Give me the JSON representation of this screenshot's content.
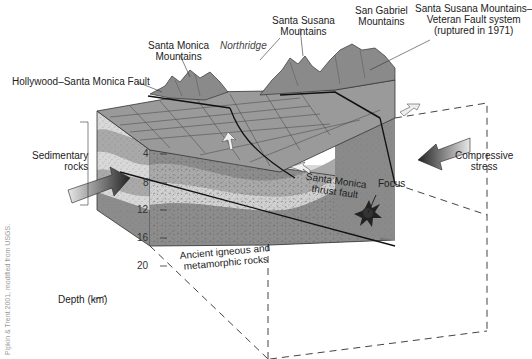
{
  "diagram": {
    "labels": {
      "santa_monica_mountains": [
        "Santa Monica",
        "Mountains"
      ],
      "northridge": "Northridge",
      "santa_susana_mountains": [
        "Santa Susana",
        "Mountains"
      ],
      "san_gabriel_mountains": [
        "San Gabriel",
        "Mountains"
      ],
      "fault_system": [
        "Santa Susana Mountains–",
        "Veteran Fault system",
        "(ruptured in 1971)"
      ],
      "hollywood_fault": "Hollywood–Santa Monica Fault",
      "sedimentary_rocks": [
        "Sedimentary",
        "rocks"
      ],
      "compressive_stress": [
        "Compressive",
        "stress"
      ],
      "thrust_fault": [
        "Santa Monica",
        "thrust fault"
      ],
      "focus": "Focus",
      "ancient_rocks": [
        "Ancient igneous and",
        "metamorphic rocks"
      ],
      "depth_axis": "Depth (km)"
    },
    "depth_ticks": [
      "4",
      "8",
      "12",
      "16",
      "20"
    ],
    "credit": "Pipkin & Trent 2001, modified from USGS.",
    "colors": {
      "light_layer": "#d8d8d8",
      "dark_layer": "#a9a9a9",
      "basement": "#8c8c8c",
      "surface": "#9a9a9a",
      "mountains": "#8a8a8a",
      "arrow_light": "#e8e8e8",
      "arrow_dark": "#333333"
    }
  }
}
